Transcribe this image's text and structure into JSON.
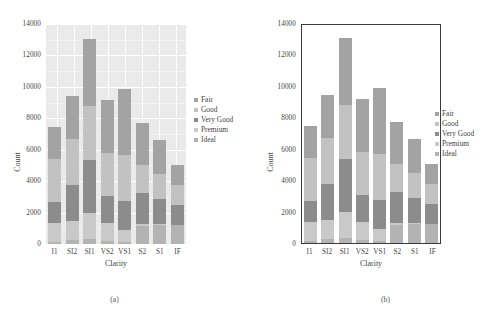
{
  "figure": {
    "panels": [
      {
        "key": "a",
        "caption": "(a)",
        "style": "gray-background-with-white-gridlines"
      },
      {
        "key": "b",
        "caption": "(b)",
        "style": "white-background-with-black-frame"
      }
    ]
  },
  "chart_data": {
    "type": "bar",
    "subtype": "stacked",
    "title": "",
    "xlabel": "Clarity",
    "ylabel": "Count",
    "categories": [
      "I1",
      "SI2",
      "SI1",
      "VS2",
      "VS1",
      "S2",
      "S1",
      "IF"
    ],
    "yticks": [
      0,
      2000,
      4000,
      6000,
      8000,
      10000,
      12000,
      14000
    ],
    "ylim": [
      0,
      14000
    ],
    "grid": "horizontal-and-vertical-white-on-gray (panel a only)",
    "legend_position": "right",
    "series": [
      {
        "name": "Ideal",
        "color": "#b3b3b3",
        "values": [
          150,
          270,
          300,
          200,
          130,
          1130,
          1200,
          1210
        ]
      },
      {
        "name": "Premium",
        "color": "#c9c9c9",
        "values": [
          1180,
          1180,
          1700,
          1130,
          760,
          130,
          60,
          10
        ]
      },
      {
        "name": "Very Good",
        "color": "#8c8c8c",
        "values": [
          1330,
          2310,
          3350,
          1700,
          1840,
          1980,
          1630,
          1240
        ]
      },
      {
        "name": "Good",
        "color": "#c2c2c2",
        "values": [
          2770,
          2930,
          3440,
          2740,
          2960,
          1780,
          1540,
          1300
        ]
      },
      {
        "name": "Fair",
        "color": "#a3a3a3",
        "values": [
          2000,
          2720,
          4280,
          3370,
          4190,
          2700,
          2180,
          1280
        ]
      }
    ],
    "totals": [
      7430,
      9410,
      13070,
      9140,
      9880,
      7720,
      6610,
      5050
    ],
    "legend_entries": [
      "Fair",
      "Good",
      "Very Good",
      "Premium",
      "Ideal"
    ]
  },
  "colors": {
    "panel_a_background": "#eaeaea",
    "panel_a_gridline": "#ffffff",
    "panel_b_frame": "#3a3a3a",
    "text": "#3f3f3f",
    "page_background": "#ffffff"
  }
}
